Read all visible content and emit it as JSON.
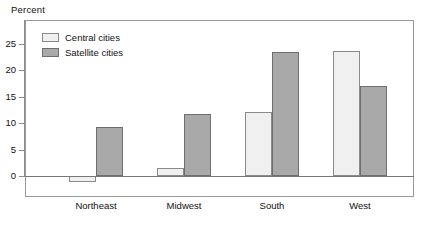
{
  "chart_data": {
    "type": "bar",
    "title": "",
    "ylabel": "Percent",
    "xlabel": "",
    "categories": [
      "Northeast",
      "Midwest",
      "South",
      "West"
    ],
    "series": [
      {
        "name": "Central cities",
        "color": "#f0f0f0",
        "values": [
          -1.2,
          1.6,
          12.2,
          23.7
        ]
      },
      {
        "name": "Satellite cities",
        "color": "#a9a9a9",
        "values": [
          9.2,
          11.7,
          23.4,
          17.0
        ]
      }
    ],
    "ylim": [
      -3,
      28
    ],
    "yticks": [
      0,
      5,
      10,
      15,
      20,
      25
    ],
    "ytick_labels": [
      "0",
      "5",
      "10",
      "15",
      "20",
      "25"
    ],
    "grid": false,
    "legend_position": "top-left",
    "zero_line": true
  },
  "axis": {
    "y_title": "Percent"
  },
  "legend": {
    "items": [
      {
        "label": "Central cities"
      },
      {
        "label": "Satellite cities"
      }
    ]
  }
}
